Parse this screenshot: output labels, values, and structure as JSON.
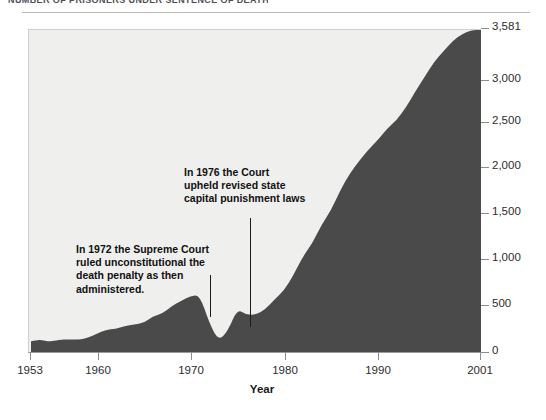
{
  "caption": {
    "text_clipped": "NUMBER OF PRISONERS UNDER SENTENCE OF DEATH"
  },
  "axes": {
    "x_title": "Year",
    "x_ticks": [
      {
        "label": "1953",
        "x": 30
      },
      {
        "label": "1960",
        "x": 98
      },
      {
        "label": "1970",
        "x": 191
      },
      {
        "label": "1980",
        "x": 285
      },
      {
        "label": "1990",
        "x": 378
      },
      {
        "label": "2001",
        "x": 480
      }
    ],
    "y_ticks": [
      {
        "label": "3,581",
        "y": 28
      },
      {
        "label": "3,000",
        "y": 80
      },
      {
        "label": "2,500",
        "y": 122
      },
      {
        "label": "2,000",
        "y": 167
      },
      {
        "label": "1,500",
        "y": 213
      },
      {
        "label": "1,000",
        "y": 259
      },
      {
        "label": "500",
        "y": 305
      },
      {
        "label": "0",
        "y": 352
      }
    ]
  },
  "annotations": [
    {
      "name": "annotation-1972",
      "text": "In 1972 the Supreme Court\nruled unconstitutional the\ndeath penalty as then\nadministered."
    },
    {
      "name": "annotation-1976",
      "text": "In 1976 the Court\nupheld revised state\ncapital punishment laws"
    }
  ],
  "colors": {
    "area_fill": "#4a4a4a",
    "plot_background": "#efefee",
    "page_background": "#ffffff",
    "axis": "#8d8d8d",
    "text": "#1a1a1a"
  },
  "chart_data": {
    "type": "area",
    "title": "NUMBER OF PRISONERS UNDER SENTENCE OF DEATH",
    "xlabel": "Year",
    "ylabel": "",
    "xlim": [
      1953,
      2001
    ],
    "ylim": [
      0,
      3581
    ],
    "grid": false,
    "legend": "none",
    "x": [
      1953,
      1954,
      1955,
      1956,
      1957,
      1958,
      1959,
      1960,
      1961,
      1962,
      1963,
      1964,
      1965,
      1966,
      1967,
      1968,
      1969,
      1970,
      1971,
      1972,
      1973,
      1974,
      1975,
      1976,
      1977,
      1978,
      1979,
      1980,
      1981,
      1982,
      1983,
      1984,
      1985,
      1986,
      1987,
      1988,
      1989,
      1990,
      1991,
      1992,
      1993,
      1994,
      1995,
      1996,
      1997,
      1998,
      1999,
      2000,
      2001
    ],
    "values": [
      131,
      147,
      125,
      146,
      151,
      147,
      164,
      210,
      257,
      267,
      297,
      315,
      331,
      406,
      435,
      517,
      575,
      631,
      642,
      334,
      134,
      244,
      488,
      420,
      423,
      482,
      593,
      692,
      860,
      1066,
      1209,
      1420,
      1575,
      1800,
      1984,
      2124,
      2250,
      2356,
      2482,
      2575,
      2716,
      2890,
      3054,
      3219,
      3335,
      3452,
      3527,
      3593,
      3581
    ],
    "data_labels": [
      {
        "x": 2001,
        "y": 3581,
        "label": "3,581"
      }
    ],
    "annotations": [
      {
        "x": 1972,
        "text": "In 1972 the Supreme Court ruled unconstitutional the death penalty as then administered."
      },
      {
        "x": 1976,
        "text": "In 1976 the Court upheld revised state capital punishment laws"
      }
    ]
  }
}
